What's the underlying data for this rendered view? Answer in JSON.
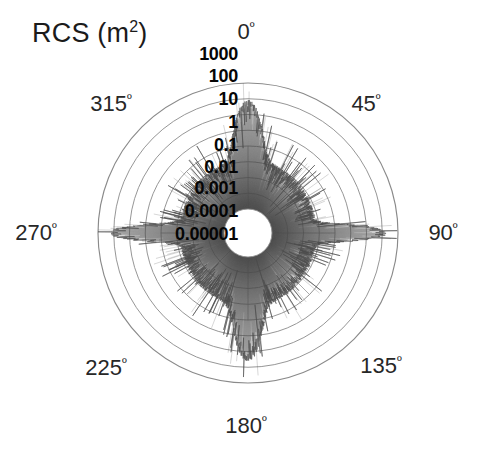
{
  "chart_data": {
    "type": "line",
    "plot_kind": "polar-radar-cross-section",
    "title_text": "RCS (m",
    "title_sup": "2",
    "title_suffix": ")",
    "xlabel": "Aspect angle (degrees)",
    "ylabel": "RCS (m²)",
    "grid": true,
    "legend": null,
    "radial_scale": "log10",
    "radial_ticks": [
      "1000",
      "100",
      "10",
      "1",
      "0.1",
      "0.01",
      "0.001",
      "0.0001",
      "0.00001"
    ],
    "radial_tick_values": [
      1000,
      100,
      10,
      1,
      0.1,
      0.01,
      0.001,
      0.0001,
      1e-05
    ],
    "rlim": [
      1e-05,
      1000
    ],
    "angular_ticks": [
      "0",
      "45",
      "90",
      "135",
      "180",
      "225",
      "270",
      "315"
    ],
    "angular_tick_labels": [
      "0º",
      "45º",
      "90º",
      "135º",
      "180º",
      "225º",
      "270º",
      "315º"
    ],
    "angular_unit": "º",
    "angular_range": [
      0,
      360
    ],
    "angular_direction": "clockwise",
    "zero_location": "top",
    "trace_color": "#4a4a4a",
    "grid_color": "#8a8a8a",
    "background_color": "#ffffff",
    "series": [
      {
        "name": "RCS vs aspect angle",
        "description": "Dense noisy radar cross section returns, mean level near 0.01-1 m^2 with specular spikes",
        "specular_peaks": [
          {
            "angle": 0,
            "value": 30,
            "label": "nose-on"
          },
          {
            "angle": 90,
            "value": 300,
            "label": "broadside-right"
          },
          {
            "angle": 180,
            "value": 60,
            "label": "tail-on"
          },
          {
            "angle": 270,
            "value": 300,
            "label": "broadside-left"
          }
        ],
        "mean_level": 0.05,
        "min_value": 1e-05,
        "max_value": 1000
      }
    ]
  },
  "axes": {
    "center_x": 248,
    "center_y": 233,
    "outer_radius": 150,
    "inner_radius": 24
  },
  "angle_labels": [
    {
      "text": "0",
      "sup": "º",
      "x": 246,
      "y": 32,
      "angle": 0
    },
    {
      "text": "45",
      "sup": "º",
      "x": 366,
      "y": 104,
      "angle": 45
    },
    {
      "text": "90",
      "sup": "º",
      "x": 443,
      "y": 233,
      "angle": 90
    },
    {
      "text": "135",
      "sup": "º",
      "x": 381,
      "y": 366,
      "angle": 135
    },
    {
      "text": "180",
      "sup": "º",
      "x": 246,
      "y": 426,
      "angle": 180
    },
    {
      "text": "225",
      "sup": "º",
      "x": 106,
      "y": 368,
      "angle": 225
    },
    {
      "text": "270",
      "sup": "º",
      "x": 36,
      "y": 233,
      "angle": 270
    },
    {
      "text": "315",
      "sup": "º",
      "x": 111,
      "y": 104,
      "angle": 315
    }
  ],
  "radial_labels": [
    {
      "text": "1000",
      "x": 238,
      "y": 54
    },
    {
      "text": "100",
      "x": 238,
      "y": 76
    },
    {
      "text": "10",
      "x": 238,
      "y": 99
    },
    {
      "text": "1",
      "x": 238,
      "y": 122
    },
    {
      "text": "0.1",
      "x": 238,
      "y": 145
    },
    {
      "text": "0.01",
      "x": 238,
      "y": 167
    },
    {
      "text": "0.001",
      "x": 238,
      "y": 188
    },
    {
      "text": "0.0001",
      "x": 238,
      "y": 211
    },
    {
      "text": "0.00001",
      "x": 238,
      "y": 234
    }
  ]
}
